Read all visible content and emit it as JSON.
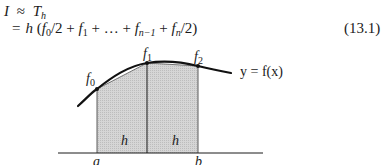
{
  "equation": {
    "line1": {
      "lhs": "I",
      "rel": "≈",
      "T": "T",
      "T_sub": "h"
    },
    "line2": {
      "rel": "=",
      "h": "h",
      "open": " (",
      "f0": "f",
      "f0_sub": "0",
      "div2a": "/2 + ",
      "f1": "f",
      "f1_sub": "1",
      "plus1": " + … + ",
      "fn1": "f",
      "fn1_sub": "n−1",
      "plus2": " + ",
      "fn": "f",
      "fn_sub": "n",
      "close": "/2)"
    },
    "number": "(13.1)"
  },
  "figure": {
    "labels": {
      "f0": "f",
      "f0_sub": "0",
      "f1": "f",
      "f1_sub": "1",
      "f2": "f",
      "f2_sub": "2",
      "curve": "y = f(x)",
      "h_left": "h",
      "h_right": "h",
      "a": "a",
      "b": "b"
    },
    "colors": {
      "shade": "#cfcfcf",
      "line": "#1a1a1a"
    }
  }
}
